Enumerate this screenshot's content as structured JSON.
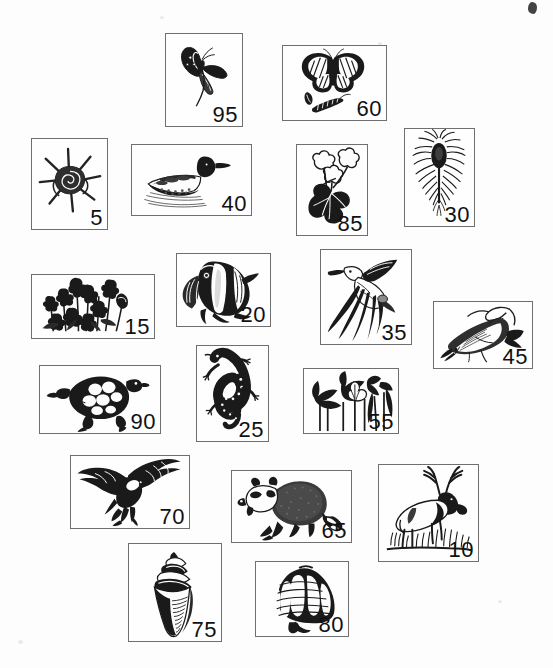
{
  "page": {
    "width": 553,
    "height": 668,
    "background_color": "#fdfdfd",
    "card_border_color": "#6f6f6f",
    "ink_color": "#111111"
  },
  "cards": [
    {
      "id": "card-95",
      "number": "95",
      "subject": "swallowtail-butterfly",
      "icon": "butterfly-swallowtail-icon",
      "x": 165,
      "y": 33,
      "w": 78,
      "h": 94
    },
    {
      "id": "card-60",
      "number": "60",
      "subject": "monarch-butterfly-with-caterpillar-and-chrysalis",
      "icon": "butterfly-monarch-icon",
      "x": 282,
      "y": 45,
      "w": 105,
      "h": 76
    },
    {
      "id": "card-5",
      "number": "5",
      "subject": "spiny-sea-snail-shell",
      "icon": "spiny-shell-icon",
      "x": 31,
      "y": 138,
      "w": 77,
      "h": 92
    },
    {
      "id": "card-40",
      "number": "40",
      "subject": "loon-swimming",
      "icon": "loon-bird-icon",
      "x": 131,
      "y": 144,
      "w": 121,
      "h": 72
    },
    {
      "id": "card-85",
      "number": "85",
      "subject": "geranium-flower-plant",
      "icon": "geranium-flower-icon",
      "x": 296,
      "y": 144,
      "w": 72,
      "h": 92
    },
    {
      "id": "card-30",
      "number": "30",
      "subject": "thistle-seed-head",
      "icon": "thistle-icon",
      "x": 404,
      "y": 128,
      "w": 71,
      "h": 99
    },
    {
      "id": "card-15",
      "number": "15",
      "subject": "wildflower-cluster",
      "icon": "wildflowers-icon",
      "x": 31,
      "y": 274,
      "w": 124,
      "h": 65
    },
    {
      "id": "card-20",
      "number": "20",
      "subject": "angelfish",
      "icon": "angelfish-icon",
      "x": 176,
      "y": 253,
      "w": 95,
      "h": 74
    },
    {
      "id": "card-35",
      "number": "35",
      "subject": "heron-in-flight",
      "icon": "heron-flying-icon",
      "x": 320,
      "y": 249,
      "w": 92,
      "h": 96
    },
    {
      "id": "card-45",
      "number": "45",
      "subject": "fish-on-hook",
      "icon": "hooked-fish-icon",
      "x": 433,
      "y": 301,
      "w": 100,
      "h": 68
    },
    {
      "id": "card-90",
      "number": "90",
      "subject": "turtle",
      "icon": "turtle-icon",
      "x": 39,
      "y": 365,
      "w": 122,
      "h": 69
    },
    {
      "id": "card-25",
      "number": "25",
      "subject": "salamander",
      "icon": "salamander-icon",
      "x": 196,
      "y": 345,
      "w": 73,
      "h": 97
    },
    {
      "id": "card-55",
      "number": "55",
      "subject": "marsh-plants-with-lotus",
      "icon": "marsh-plants-icon",
      "x": 303,
      "y": 368,
      "w": 96,
      "h": 66
    },
    {
      "id": "card-70",
      "number": "70",
      "subject": "bald-eagle-in-flight",
      "icon": "eagle-flying-icon",
      "x": 70,
      "y": 455,
      "w": 120,
      "h": 74
    },
    {
      "id": "card-65",
      "number": "65",
      "subject": "raccoon",
      "icon": "raccoon-icon",
      "x": 231,
      "y": 470,
      "w": 121,
      "h": 73
    },
    {
      "id": "card-10",
      "number": "10",
      "subject": "elk-in-grass",
      "icon": "elk-icon",
      "x": 378,
      "y": 464,
      "w": 101,
      "h": 98
    },
    {
      "id": "card-75",
      "number": "75",
      "subject": "cone-shell",
      "icon": "cone-shell-icon",
      "x": 128,
      "y": 543,
      "w": 94,
      "h": 99
    },
    {
      "id": "card-80",
      "number": "80",
      "subject": "scallop-shell",
      "icon": "scallop-shell-icon",
      "x": 255,
      "y": 561,
      "w": 94,
      "h": 76
    }
  ],
  "artifacts": {
    "corner_smudge": {
      "x": 528,
      "y": 2,
      "label": "ink-smudge"
    }
  }
}
